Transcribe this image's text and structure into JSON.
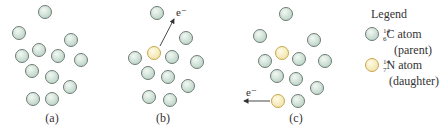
{
  "colors": {
    "carbon_fill": "#cfe3d8",
    "carbon_stroke": "#6f7d76",
    "nitrogen_fill": "#f6efc4",
    "nitrogen_stroke": "#c9a64e",
    "text": "#333333",
    "arrow": "#333333"
  },
  "panels": [
    {
      "id": "a",
      "label": "(a)",
      "label_pos": [
        52,
        122
      ],
      "atoms": [
        {
          "x": 45,
          "y": 12,
          "type": "C"
        },
        {
          "x": 19,
          "y": 33,
          "type": "C"
        },
        {
          "x": 71,
          "y": 40,
          "type": "C"
        },
        {
          "x": 22,
          "y": 56,
          "type": "C"
        },
        {
          "x": 39,
          "y": 50,
          "type": "C"
        },
        {
          "x": 58,
          "y": 56,
          "type": "C"
        },
        {
          "x": 81,
          "y": 60,
          "type": "C"
        },
        {
          "x": 32,
          "y": 71,
          "type": "C"
        },
        {
          "x": 52,
          "y": 77,
          "type": "C"
        },
        {
          "x": 70,
          "y": 87,
          "type": "C"
        },
        {
          "x": 33,
          "y": 99,
          "type": "C"
        },
        {
          "x": 52,
          "y": 99,
          "type": "C"
        }
      ]
    },
    {
      "id": "b",
      "label": "(b)",
      "label_pos": [
        163,
        122
      ],
      "electron": {
        "label": "e⁻",
        "from": [
          160,
          46
        ],
        "to": [
          174,
          19
        ],
        "label_pos": [
          176,
          16
        ]
      },
      "atoms": [
        {
          "x": 157,
          "y": 13,
          "type": "C"
        },
        {
          "x": 186,
          "y": 38,
          "type": "C"
        },
        {
          "x": 154,
          "y": 53,
          "type": "N"
        },
        {
          "x": 135,
          "y": 58,
          "type": "C"
        },
        {
          "x": 172,
          "y": 57,
          "type": "C"
        },
        {
          "x": 197,
          "y": 62,
          "type": "C"
        },
        {
          "x": 148,
          "y": 73,
          "type": "C"
        },
        {
          "x": 168,
          "y": 77,
          "type": "C"
        },
        {
          "x": 188,
          "y": 86,
          "type": "C"
        },
        {
          "x": 149,
          "y": 97,
          "type": "C"
        },
        {
          "x": 170,
          "y": 100,
          "type": "C"
        }
      ]
    },
    {
      "id": "c",
      "label": "(c)",
      "label_pos": [
        296,
        122
      ],
      "electron": {
        "label": "e⁻",
        "from": [
          270,
          101
        ],
        "to": [
          244,
          101
        ],
        "label_pos": [
          246,
          96
        ]
      },
      "atoms": [
        {
          "x": 286,
          "y": 14,
          "type": "C"
        },
        {
          "x": 260,
          "y": 36,
          "type": "C"
        },
        {
          "x": 314,
          "y": 40,
          "type": "C"
        },
        {
          "x": 282,
          "y": 53,
          "type": "N"
        },
        {
          "x": 265,
          "y": 61,
          "type": "C"
        },
        {
          "x": 299,
          "y": 59,
          "type": "C"
        },
        {
          "x": 325,
          "y": 61,
          "type": "C"
        },
        {
          "x": 277,
          "y": 76,
          "type": "C"
        },
        {
          "x": 296,
          "y": 79,
          "type": "C"
        },
        {
          "x": 317,
          "y": 88,
          "type": "C"
        },
        {
          "x": 278,
          "y": 101,
          "type": "N"
        },
        {
          "x": 298,
          "y": 101,
          "type": "C"
        }
      ]
    }
  ],
  "legend": {
    "title": "Legend",
    "items": [
      {
        "type": "C",
        "mass": "14",
        "atomic": "6",
        "symbol": "C",
        "name": " atom",
        "role": "(parent)"
      },
      {
        "type": "N",
        "mass": "14",
        "atomic": "7",
        "symbol": "N",
        "name": " atom",
        "role": "(daughter)"
      }
    ]
  }
}
